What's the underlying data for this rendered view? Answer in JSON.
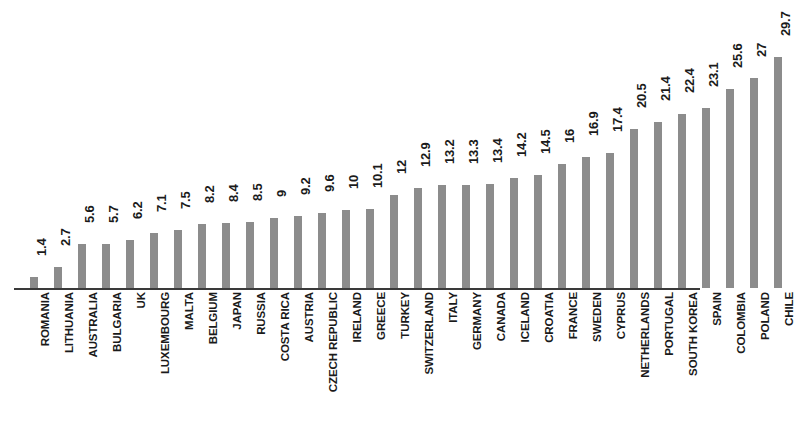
{
  "chart_data": {
    "type": "bar",
    "title": "",
    "subtitle": "",
    "xlabel": "",
    "ylabel": "",
    "grid": false,
    "legend": null,
    "ylim": [
      0,
      29.7
    ],
    "orientation": "vertical",
    "bar_color": "#8c8c8c",
    "axis_color": "#3a3a3a",
    "text_color": "#1a1a1a",
    "value_labels_shown": true,
    "categories": [
      "ROMANIA",
      "LITHUANIA",
      "AUSTRALIA",
      "BULGARIA",
      "UK",
      "LUXEMBOURG",
      "MALTA",
      "BELGIUM",
      "JAPAN",
      "RUSSIA",
      "COSTA RICA",
      "AUSTRIA",
      "CZECH REPUBLIC",
      "IRELAND",
      "GREECE",
      "TURKEY",
      "SWITZERLAND",
      "ITALY",
      "GERMANY",
      "CANADA",
      "ICELAND",
      "CROATIA",
      "FRANCE",
      "SWEDEN",
      "CYPRUS",
      "NETHERLANDS",
      "PORTUGAL",
      "SOUTH KOREA",
      "SPAIN",
      "COLOMBIA",
      "POLAND",
      "CHILE"
    ],
    "values": [
      1.4,
      2.7,
      5.6,
      5.7,
      6.2,
      7.1,
      7.5,
      8.2,
      8.4,
      8.5,
      9,
      9.2,
      9.6,
      10,
      10.1,
      12,
      12.9,
      13.2,
      13.3,
      13.4,
      14.2,
      14.5,
      16,
      16.9,
      17.4,
      20.5,
      21.4,
      22.4,
      23.1,
      25.6,
      27,
      29.7
    ],
    "value_label_texts": [
      "1.4",
      "2.7",
      "5.6",
      "5.7",
      "6.2",
      "7.1",
      "7.5",
      "8.2",
      "8.4",
      "8.5",
      "9",
      "9.2",
      "9.6",
      "10",
      "10.1",
      "12",
      "12.9",
      "13.2",
      "13.3",
      "13.4",
      "14.2",
      "14.5",
      "16",
      "16.9",
      "17.4",
      "20.5",
      "21.4",
      "22.4",
      "23.1",
      "25.6",
      "27",
      "29.7"
    ]
  }
}
